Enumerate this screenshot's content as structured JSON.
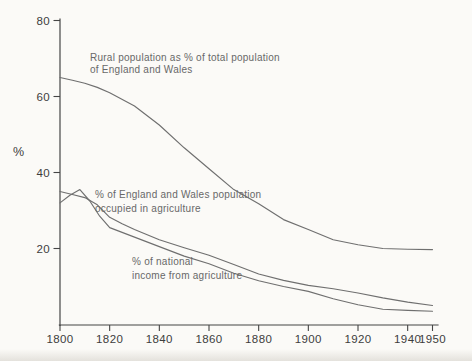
{
  "chart_data": {
    "type": "line",
    "title": "",
    "xlabel": "",
    "ylabel": "%",
    "xlim": [
      1800,
      1950
    ],
    "ylim": [
      0,
      80
    ],
    "x_ticks": [
      1800,
      1820,
      1840,
      1860,
      1880,
      1900,
      1920,
      1940,
      1950
    ],
    "y_ticks": [
      20,
      40,
      60,
      80
    ],
    "grid": false,
    "legend_position": "inline-annotations",
    "series": [
      {
        "name": "Rural population as % of total population of England and Wales",
        "x": [
          1800,
          1805,
          1810,
          1815,
          1820,
          1830,
          1840,
          1850,
          1860,
          1870,
          1880,
          1890,
          1900,
          1910,
          1920,
          1930,
          1940,
          1950
        ],
        "values": [
          65,
          64.3,
          63.5,
          62.4,
          61,
          57.5,
          52.5,
          46.5,
          41,
          35.5,
          31.8,
          27.6,
          25,
          22.3,
          21,
          20,
          19.8,
          19.7
        ]
      },
      {
        "name": "% of England and Wales population occupied in agriculture",
        "x": [
          1800,
          1805,
          1810,
          1815,
          1820,
          1825,
          1830,
          1840,
          1850,
          1860,
          1870,
          1880,
          1890,
          1900,
          1910,
          1920,
          1930,
          1940,
          1950
        ],
        "values": [
          35,
          34.2,
          33.4,
          31.5,
          28.2,
          26.5,
          25,
          22.3,
          20.2,
          18.2,
          15.8,
          13.3,
          11.6,
          10.3,
          9.4,
          8.3,
          7,
          5.9,
          5
        ]
      },
      {
        "name": "% of national income from agriculture",
        "x": [
          1800,
          1804,
          1808,
          1812,
          1816,
          1820,
          1830,
          1840,
          1850,
          1860,
          1870,
          1880,
          1890,
          1900,
          1910,
          1920,
          1930,
          1940,
          1950
        ],
        "values": [
          32,
          34,
          35.5,
          32.5,
          28.5,
          25.5,
          23,
          20.5,
          18,
          16,
          13.5,
          11.5,
          10,
          8.7,
          6.8,
          5.2,
          4,
          3.7,
          3.5
        ]
      }
    ],
    "annotations": [
      {
        "lines": [
          "Rural population as % of total population",
          "of England and Wales"
        ]
      },
      {
        "lines": [
          "% of England and Wales population",
          "occupied in agriculture"
        ]
      },
      {
        "lines": [
          "% of national",
          "income from agriculture"
        ]
      }
    ],
    "line_color": "#6f6f6f",
    "axis_color": "#454545",
    "background_color": "#fbfaf7"
  }
}
